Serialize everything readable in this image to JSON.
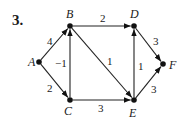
{
  "problem": {
    "number": "3."
  },
  "graph": {
    "directed": true,
    "nodes": [
      {
        "id": "A",
        "label": "A",
        "x": 39,
        "y": 62,
        "lx": 28,
        "ly": 66
      },
      {
        "id": "B",
        "label": "B",
        "x": 70,
        "y": 26,
        "lx": 66,
        "ly": 18
      },
      {
        "id": "C",
        "label": "C",
        "x": 70,
        "y": 100,
        "lx": 64,
        "ly": 115
      },
      {
        "id": "D",
        "label": "D",
        "x": 134,
        "y": 26,
        "lx": 130,
        "ly": 18
      },
      {
        "id": "E",
        "label": "E",
        "x": 134,
        "y": 100,
        "lx": 129,
        "ly": 117
      },
      {
        "id": "F",
        "label": "F",
        "x": 163,
        "y": 64,
        "lx": 169,
        "ly": 69
      }
    ],
    "edges": [
      {
        "from": "A",
        "to": "B",
        "weight": "4",
        "lx": 47,
        "ly": 45
      },
      {
        "from": "A",
        "to": "C",
        "weight": "2",
        "lx": 47,
        "ly": 92
      },
      {
        "from": "C",
        "to": "B",
        "weight": "−1",
        "lx": 55,
        "ly": 67
      },
      {
        "from": "B",
        "to": "D",
        "weight": "2",
        "lx": 100,
        "ly": 22
      },
      {
        "from": "B",
        "to": "E",
        "weight": "1",
        "lx": 107,
        "ly": 65
      },
      {
        "from": "C",
        "to": "E",
        "weight": "3",
        "lx": 98,
        "ly": 112
      },
      {
        "from": "E",
        "to": "D",
        "weight": "1",
        "lx": 138,
        "ly": 70
      },
      {
        "from": "D",
        "to": "F",
        "weight": "3",
        "lx": 153,
        "ly": 45
      },
      {
        "from": "E",
        "to": "F",
        "weight": "3",
        "lx": 151,
        "ly": 93
      }
    ]
  }
}
